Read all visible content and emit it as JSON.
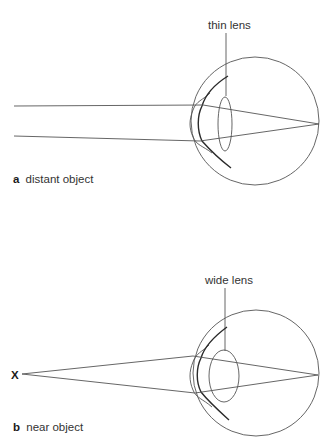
{
  "diagram": {
    "panels": [
      {
        "id": "a",
        "letter": "a",
        "caption": "distant object",
        "lens_label": "thin lens",
        "lens_shape": "thin"
      },
      {
        "id": "b",
        "letter": "b",
        "caption": "near object",
        "lens_label": "wide lens",
        "lens_shape": "wide",
        "object_marker": "X"
      }
    ]
  },
  "colors": {
    "line": "#555555",
    "dark_line": "#2a2a2a",
    "text": "#333333",
    "background": "#ffffff"
  }
}
